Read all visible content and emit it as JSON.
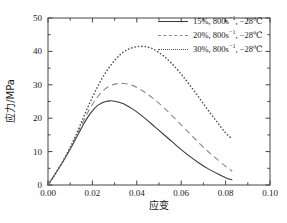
{
  "chart_data": {
    "type": "line",
    "title": "",
    "xlabel": "应变",
    "ylabel": "应力/MPa",
    "xlim": [
      0.0,
      0.1
    ],
    "ylim": [
      0,
      50
    ],
    "xticks": [
      "0.00",
      "0.02",
      "0.04",
      "0.06",
      "0.08",
      "0.10"
    ],
    "xtick_values": [
      0.0,
      0.02,
      0.04,
      0.06,
      0.08,
      0.1
    ],
    "yticks": [
      "0",
      "10",
      "20",
      "30",
      "40",
      "50"
    ],
    "ytick_values": [
      0,
      10,
      20,
      30,
      40,
      50
    ],
    "minor_ticks": true,
    "grid": false,
    "legend_position": "upper right",
    "series": [
      {
        "name": "15%, 800s⁻¹, −28℃",
        "label_main": "15%, 800s",
        "label_sup": "−1",
        "label_tail": ", −28℃",
        "style": "solid",
        "color": "#3a3a3a",
        "x": [
          0.0,
          0.002,
          0.004,
          0.006,
          0.008,
          0.01,
          0.012,
          0.014,
          0.016,
          0.018,
          0.02,
          0.022,
          0.024,
          0.026,
          0.028,
          0.03,
          0.032,
          0.034,
          0.036,
          0.038,
          0.04,
          0.044,
          0.048,
          0.052,
          0.056,
          0.06,
          0.064,
          0.068,
          0.072,
          0.076,
          0.08,
          0.083
        ],
        "y": [
          0.0,
          2.0,
          4.1,
          6.2,
          8.4,
          10.7,
          13.2,
          15.7,
          18.2,
          20.4,
          22.2,
          23.6,
          24.5,
          25.0,
          25.2,
          25.1,
          24.8,
          24.3,
          23.6,
          22.8,
          21.9,
          19.8,
          17.5,
          15.2,
          12.9,
          10.6,
          8.5,
          6.6,
          4.9,
          3.5,
          2.2,
          1.5
        ]
      },
      {
        "name": "20%, 800s⁻¹, −28℃",
        "label_main": "20%, 800s",
        "label_sup": "−1",
        "label_tail": ", −28℃",
        "style": "dashed",
        "color": "#8a8a8a",
        "x": [
          0.0,
          0.002,
          0.004,
          0.006,
          0.008,
          0.01,
          0.012,
          0.014,
          0.016,
          0.018,
          0.02,
          0.022,
          0.024,
          0.026,
          0.028,
          0.03,
          0.032,
          0.034,
          0.036,
          0.038,
          0.04,
          0.044,
          0.048,
          0.052,
          0.056,
          0.06,
          0.064,
          0.068,
          0.072,
          0.076,
          0.08,
          0.083
        ],
        "y": [
          0.0,
          2.0,
          4.1,
          6.3,
          8.6,
          11.0,
          13.6,
          16.4,
          19.2,
          21.8,
          24.1,
          26.1,
          27.7,
          28.9,
          29.7,
          30.2,
          30.4,
          30.4,
          30.2,
          29.8,
          29.2,
          27.6,
          25.6,
          23.3,
          20.7,
          18.0,
          15.3,
          12.6,
          10.1,
          7.8,
          5.6,
          4.1
        ]
      },
      {
        "name": "30%, 800s⁻¹, −28℃",
        "label_main": "30%, 800s",
        "label_sup": "−1",
        "label_tail": ", −28℃",
        "style": "dotted",
        "color": "#555555",
        "x": [
          0.0,
          0.002,
          0.004,
          0.006,
          0.008,
          0.01,
          0.012,
          0.014,
          0.016,
          0.018,
          0.02,
          0.022,
          0.024,
          0.026,
          0.028,
          0.03,
          0.032,
          0.034,
          0.036,
          0.038,
          0.04,
          0.042,
          0.044,
          0.046,
          0.048,
          0.052,
          0.056,
          0.06,
          0.064,
          0.068,
          0.072,
          0.076,
          0.08,
          0.083
        ],
        "y": [
          0.0,
          2.0,
          4.1,
          6.3,
          8.7,
          11.3,
          14.1,
          17.1,
          20.3,
          23.4,
          26.3,
          29.0,
          31.5,
          33.7,
          35.6,
          37.3,
          38.7,
          39.8,
          40.6,
          41.1,
          41.4,
          41.5,
          41.4,
          41.1,
          40.5,
          38.7,
          36.2,
          33.2,
          29.8,
          26.2,
          22.5,
          19.0,
          15.6,
          13.8
        ]
      }
    ]
  },
  "axes": {
    "frame_color": "#444444"
  }
}
